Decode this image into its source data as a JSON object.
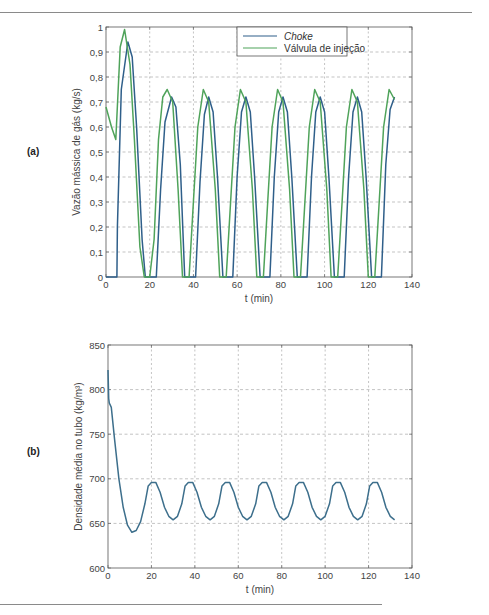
{
  "figure": {
    "panel_a_label": "(a)",
    "panel_b_label": "(b)"
  },
  "colors": {
    "choke": "#2f5f8a",
    "valvula": "#4fa35a",
    "density": "#3d6f8c",
    "grid": "#9a9a9a",
    "axis": "#555555"
  },
  "chart_data": [
    {
      "type": "line",
      "panel": "(a)",
      "title": "",
      "xlabel": "t (min)",
      "ylabel": "Vazão mássica de gás (kg/s)",
      "xlim": [
        0,
        140
      ],
      "ylim": [
        0,
        1
      ],
      "xticks": [
        "0",
        "20",
        "40",
        "60",
        "80",
        "100",
        "120",
        "140"
      ],
      "yticks": [
        "0",
        "0,1",
        "0,2",
        "0,3",
        "0,4",
        "0,5",
        "0,6",
        "0,7",
        "0,8",
        "0,9",
        "1"
      ],
      "grid": true,
      "legend_position": "upper right",
      "series": [
        {
          "name": "Choke",
          "legend_style": "italic",
          "x": [
            0,
            5,
            5.2,
            7,
            10,
            12,
            14,
            16.5,
            18,
            23,
            25,
            27,
            30,
            32,
            34,
            36,
            41,
            43,
            45,
            47,
            49,
            51,
            53.5,
            58,
            60,
            62,
            64,
            66,
            68,
            70.5,
            75,
            77,
            79,
            81,
            83,
            85,
            87.5,
            92,
            94,
            96,
            98,
            100,
            102,
            104.5,
            109,
            111,
            113,
            115,
            117,
            119,
            121.5,
            126,
            128,
            130,
            132
          ],
          "y": [
            0,
            0,
            0.2,
            0.75,
            0.94,
            0.88,
            0.6,
            0.15,
            0,
            0,
            0.35,
            0.62,
            0.72,
            0.68,
            0.45,
            0,
            0,
            0.38,
            0.65,
            0.72,
            0.66,
            0.4,
            0,
            0,
            0.4,
            0.66,
            0.72,
            0.66,
            0.4,
            0,
            0,
            0.4,
            0.66,
            0.72,
            0.66,
            0.4,
            0,
            0,
            0.4,
            0.66,
            0.72,
            0.66,
            0.4,
            0,
            0,
            0.4,
            0.66,
            0.72,
            0.66,
            0.4,
            0,
            0,
            0.45,
            0.67,
            0.72
          ]
        },
        {
          "name": "Válvula de injeção",
          "x": [
            0,
            2.5,
            4.5,
            6.5,
            8.5,
            11,
            13,
            15.5,
            17.5,
            20,
            22,
            24,
            26,
            28,
            30.5,
            33,
            35,
            38,
            40,
            42,
            44.5,
            47,
            50,
            52,
            55,
            57,
            59,
            61.5,
            64,
            67,
            69,
            72,
            74,
            76,
            78.5,
            81,
            84,
            86,
            89,
            91,
            93,
            95.5,
            98,
            101,
            103,
            106,
            108,
            110,
            112.5,
            115,
            118,
            120,
            123,
            125,
            127,
            129.5,
            132
          ],
          "y": [
            0.68,
            0.6,
            0.55,
            0.92,
            0.99,
            0.85,
            0.55,
            0.12,
            0,
            0,
            0.15,
            0.55,
            0.72,
            0.75,
            0.7,
            0.35,
            0,
            0,
            0.3,
            0.6,
            0.75,
            0.7,
            0.35,
            0,
            0,
            0.3,
            0.6,
            0.75,
            0.7,
            0.35,
            0,
            0,
            0.3,
            0.6,
            0.75,
            0.7,
            0.35,
            0,
            0,
            0.3,
            0.6,
            0.75,
            0.7,
            0.35,
            0,
            0,
            0.3,
            0.6,
            0.75,
            0.7,
            0.35,
            0,
            0,
            0.3,
            0.6,
            0.75,
            0.71
          ]
        }
      ]
    },
    {
      "type": "line",
      "panel": "(b)",
      "title": "",
      "xlabel": "t (min)",
      "ylabel": "Densidade média no tubo (kg/m³)",
      "xlim": [
        0,
        140
      ],
      "ylim": [
        600,
        850
      ],
      "xticks": [
        "0",
        "20",
        "40",
        "60",
        "80",
        "100",
        "120",
        "140"
      ],
      "yticks": [
        "600",
        "650",
        "700",
        "750",
        "800",
        "850"
      ],
      "grid": true,
      "series": [
        {
          "name": "Densidade",
          "x": [
            0,
            0.3,
            0.6,
            1.5,
            3,
            5,
            7,
            9,
            11,
            13,
            15,
            17,
            18.5,
            20,
            22,
            24,
            26,
            28,
            30,
            32,
            34,
            35.5,
            37,
            39,
            41,
            43,
            45,
            47,
            49,
            51,
            52.5,
            54,
            56,
            58,
            60,
            62,
            64,
            66,
            68,
            69.5,
            71,
            73,
            75,
            77,
            79,
            81,
            83,
            85,
            86.5,
            88,
            90,
            92,
            94,
            96,
            98,
            100,
            102,
            103.5,
            105,
            107,
            109,
            111,
            113,
            115,
            117,
            119,
            120.5,
            122,
            124,
            126,
            128,
            130,
            132
          ],
          "y": [
            822,
            790,
            785,
            780,
            745,
            700,
            668,
            648,
            640,
            642,
            652,
            672,
            692,
            696,
            696,
            685,
            668,
            658,
            654,
            658,
            672,
            692,
            696,
            696,
            685,
            668,
            658,
            654,
            658,
            672,
            692,
            696,
            696,
            685,
            668,
            658,
            654,
            658,
            672,
            692,
            696,
            696,
            685,
            668,
            658,
            654,
            658,
            672,
            692,
            696,
            696,
            685,
            668,
            658,
            654,
            658,
            672,
            692,
            696,
            696,
            685,
            668,
            658,
            654,
            658,
            672,
            692,
            696,
            696,
            685,
            668,
            658,
            654
          ]
        }
      ]
    }
  ]
}
